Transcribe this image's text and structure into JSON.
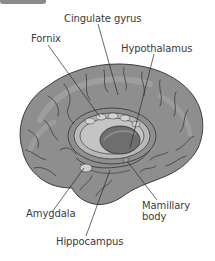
{
  "figure": {
    "type": "anatomical-diagram",
    "labels": [
      {
        "id": "cingulate-gyrus",
        "text": "Cingulate gyrus"
      },
      {
        "id": "fornix",
        "text": "Fornix"
      },
      {
        "id": "hypothalamus",
        "text": "Hypothalamus"
      },
      {
        "id": "amygdala",
        "text": "Amygdala"
      },
      {
        "id": "mamillary-body",
        "text": "Mamillary body",
        "lines": [
          "Mamillary",
          "body"
        ]
      },
      {
        "id": "hippocampus",
        "text": "Hippocampus"
      }
    ],
    "colors": {
      "cortex": "#8e8e8e",
      "cortex_light": "#a9a9a9",
      "sulci": "#3c3c3c",
      "limbic_highlight": "#c4c4c4",
      "thalamus": "#6e6e6e",
      "leader_line": "#2a2a2a",
      "text": "#3a3a3a",
      "tab": "#8a8a8a"
    }
  }
}
